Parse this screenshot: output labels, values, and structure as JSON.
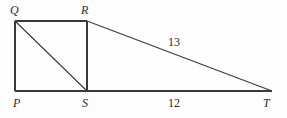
{
  "figure": {
    "type": "geometry-diagram",
    "background_color": "#fdfdfd",
    "stroke_color": "#3a3a3a",
    "text_color": "#2b2b2b",
    "vertices": [
      {
        "id": "Q",
        "label": "Q",
        "x": 15,
        "y": 21,
        "label_x": 10,
        "label_y": 4,
        "label_position": "above-left"
      },
      {
        "id": "R",
        "label": "R",
        "x": 87,
        "y": 21,
        "label_x": 81,
        "label_y": 4,
        "label_position": "above-left"
      },
      {
        "id": "P",
        "label": "P",
        "x": 15,
        "y": 91,
        "label_x": 13,
        "label_y": 97,
        "label_position": "below-left"
      },
      {
        "id": "S",
        "label": "S",
        "x": 87,
        "y": 91,
        "label_x": 82,
        "label_y": 97,
        "label_position": "below"
      },
      {
        "id": "T",
        "label": "T",
        "x": 272,
        "y": 91,
        "label_x": 263,
        "label_y": 97,
        "label_position": "below-right"
      }
    ],
    "segments": [
      {
        "id": "QR",
        "from": "Q",
        "to": "R",
        "x1": 15,
        "y1": 21,
        "x2": 87,
        "y2": 21
      },
      {
        "id": "QP",
        "from": "Q",
        "to": "P",
        "x1": 15,
        "y1": 21,
        "x2": 15,
        "y2": 91
      },
      {
        "id": "RS",
        "from": "R",
        "to": "S",
        "x1": 87,
        "y1": 21,
        "x2": 87,
        "y2": 91
      },
      {
        "id": "PT",
        "from": "P",
        "to": "T",
        "x1": 15,
        "y1": 91,
        "x2": 272,
        "y2": 91
      },
      {
        "id": "QS",
        "from": "Q",
        "to": "S",
        "x1": 15,
        "y1": 21,
        "x2": 87,
        "y2": 91
      },
      {
        "id": "RT",
        "from": "R",
        "to": "T",
        "x1": 87,
        "y1": 21,
        "x2": 272,
        "y2": 91
      }
    ],
    "measures": [
      {
        "id": "RT-length",
        "segment": "RT",
        "value": "13",
        "x": 168,
        "y": 36
      },
      {
        "id": "ST-length",
        "segment": "ST",
        "value": "12",
        "x": 168,
        "y": 97
      }
    ]
  }
}
